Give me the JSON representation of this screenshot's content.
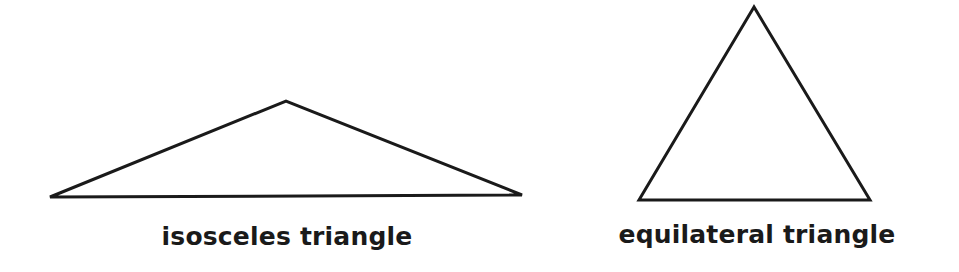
{
  "colors": {
    "background": "#ffffff",
    "stroke": "#1a1a1a",
    "text": "#1a1a1a"
  },
  "figures": [
    {
      "id": "isosceles",
      "label": "isosceles triangle",
      "points": "50,197 286,101 522,195",
      "label_x": 287,
      "label_y": 222
    },
    {
      "id": "equilateral",
      "label": "equilateral triangle",
      "points": "754,7 639,200 870,200",
      "label_x": 757,
      "label_y": 220
    }
  ]
}
